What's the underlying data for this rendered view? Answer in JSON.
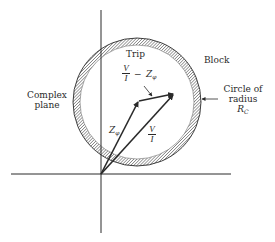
{
  "diagram": {
    "title_region_labels": {
      "trip": "Trip",
      "block": "Block",
      "complex_plane_line1": "Complex",
      "complex_plane_line2": "plane"
    },
    "circle_label": {
      "line1": "Circle of",
      "line2": "radius",
      "symbol": "R",
      "subscript": "C"
    },
    "vectors": {
      "z_phi": {
        "symbol": "Z",
        "subscript": "φ"
      },
      "v_over_i": {
        "numerator": "V",
        "denominator": "I"
      },
      "difference": {
        "numerator": "V",
        "denominator": "I",
        "operator": "−",
        "symbol": "Z",
        "subscript": "φ"
      }
    },
    "colors": {
      "ink": "#2a2a2a",
      "background": "#ffffff"
    }
  }
}
